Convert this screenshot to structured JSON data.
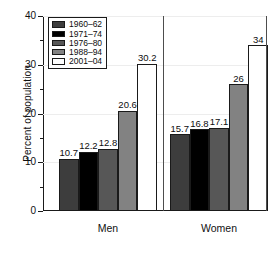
{
  "chart_data": {
    "type": "bar",
    "title": "",
    "xlabel": "",
    "ylabel": "Percent of population",
    "ylim": [
      0,
      40
    ],
    "yticks": [
      0,
      10,
      20,
      30,
      40
    ],
    "ytick_labels": [
      "0",
      "10",
      "20",
      "30",
      "40"
    ],
    "yminor_ticks": [
      5,
      15,
      25,
      35
    ],
    "grid": true,
    "legend_position": "upper left",
    "categories": [
      "Men",
      "Women"
    ],
    "series": [
      {
        "name": "1960–62",
        "color": "#3d3d3d",
        "values": [
          10.7,
          15.7
        ],
        "labels": [
          "10.7",
          "15.7"
        ]
      },
      {
        "name": "1971–74",
        "color": "#000000",
        "values": [
          12.2,
          16.8
        ],
        "labels": [
          "12.2",
          "16.8"
        ]
      },
      {
        "name": "1976–80",
        "color": "#575757",
        "values": [
          12.8,
          17.1
        ],
        "labels": [
          "12.8",
          "17.1"
        ]
      },
      {
        "name": "1988–94",
        "color": "#828282",
        "values": [
          20.6,
          26.0
        ],
        "labels": [
          "20.6",
          "26"
        ]
      },
      {
        "name": "2001–04",
        "color": "#ffffff",
        "values": [
          30.2,
          34.0
        ],
        "labels": [
          "30.2",
          "34"
        ]
      }
    ]
  },
  "axis": {
    "y_title": "Percent of population"
  },
  "legend": {
    "items": [
      {
        "label": "1960–62"
      },
      {
        "label": "1971–74"
      },
      {
        "label": "1976–80"
      },
      {
        "label": "1988–94"
      },
      {
        "label": "2001–04"
      }
    ]
  },
  "x_axis": {
    "groups": [
      {
        "label": "Men"
      },
      {
        "label": "Women"
      }
    ]
  },
  "colors": {
    "axis": "#1a1a1a",
    "grid": "#ededed",
    "background": "#ffffff",
    "text": "#0d0d0d"
  }
}
